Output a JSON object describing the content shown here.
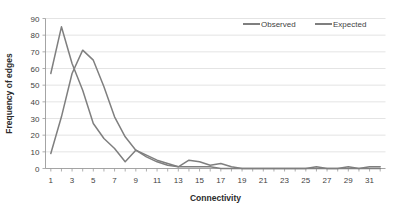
{
  "chart_data": {
    "type": "line",
    "title": "",
    "xlabel": "Connectivity",
    "ylabel": "Frequency of edges",
    "xlim": [
      0.5,
      32.5
    ],
    "ylim": [
      0,
      90
    ],
    "ytick_step": 10,
    "grid": true,
    "legend_position": "top-right",
    "x": [
      1,
      2,
      3,
      4,
      5,
      6,
      7,
      8,
      9,
      10,
      11,
      12,
      13,
      14,
      15,
      16,
      17,
      18,
      19,
      20,
      21,
      22,
      23,
      24,
      25,
      26,
      27,
      28,
      29,
      30,
      31,
      32
    ],
    "xticks": [
      1,
      3,
      5,
      7,
      9,
      11,
      13,
      15,
      17,
      19,
      21,
      23,
      25,
      27,
      29,
      31
    ],
    "yticks": [
      0,
      10,
      20,
      30,
      40,
      50,
      60,
      70,
      80,
      90
    ],
    "series": [
      {
        "name": "Observed",
        "color": "#7f7f7f",
        "values": [
          57,
          85,
          63,
          47,
          27,
          18,
          12,
          4,
          11,
          8,
          5,
          3,
          1,
          5,
          4,
          2,
          3,
          1,
          0,
          0,
          0,
          0,
          0,
          0,
          0,
          1,
          0,
          0,
          1,
          0,
          1,
          1
        ]
      },
      {
        "name": "Expected",
        "color": "#7f7f7f",
        "values": [
          9,
          31,
          57,
          71,
          65,
          49,
          31,
          19,
          11,
          7,
          4,
          2,
          1,
          1,
          1,
          1,
          0,
          0,
          0,
          0,
          0,
          0,
          0,
          0,
          0,
          0,
          0,
          0,
          0,
          0,
          0,
          0
        ]
      }
    ]
  },
  "legend": {
    "items": [
      {
        "label": "Observed"
      },
      {
        "label": "Expected"
      }
    ]
  },
  "axes": {
    "x_title": "Connectivity",
    "y_title": "Frequency of edges"
  }
}
